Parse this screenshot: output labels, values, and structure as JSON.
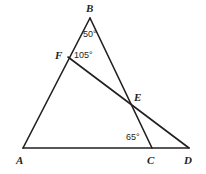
{
  "figure": {
    "type": "euclidean-geometry-diagram",
    "background_color": "#ffffff",
    "stroke_color": "#231f20",
    "text_color": "#231f20",
    "canvas": {
      "width": 206,
      "height": 174
    },
    "points": [
      {
        "id": "A",
        "label": "A",
        "x": 23,
        "y": 148,
        "label_x": 16,
        "label_y": 155
      },
      {
        "id": "B",
        "label": "B",
        "x": 90,
        "y": 18,
        "label_x": 86,
        "label_y": 3
      },
      {
        "id": "C",
        "label": "C",
        "x": 152,
        "y": 148,
        "label_x": 147,
        "label_y": 155
      },
      {
        "id": "D",
        "label": "D",
        "x": 189,
        "y": 148,
        "label_x": 184,
        "label_y": 155
      },
      {
        "id": "E",
        "label": "E",
        "x": 131,
        "y": 104,
        "label_x": 134,
        "label_y": 92
      },
      {
        "id": "F",
        "label": "F",
        "x": 68,
        "y": 57,
        "label_x": 55,
        "label_y": 50
      }
    ],
    "segments": [
      {
        "id": "AB",
        "from": "A",
        "to": "B",
        "stroke_width": 1.6
      },
      {
        "id": "BC",
        "from": "B",
        "to": "C",
        "stroke_width": 1.6
      },
      {
        "id": "AD",
        "from": "A",
        "to": "D",
        "stroke_width": 1.6
      },
      {
        "id": "FD",
        "from": "F",
        "to": "D",
        "stroke_width": 1.6
      }
    ],
    "angles": [
      {
        "id": "angle-B",
        "vertex": "B",
        "value": "50°",
        "label_x": 83,
        "label_y": 30
      },
      {
        "id": "angle-F",
        "vertex": "F",
        "value": "105°",
        "label_x": 74,
        "label_y": 51
      },
      {
        "id": "angle-C",
        "vertex": "C",
        "value": "65°",
        "label_x": 126,
        "label_y": 133
      }
    ]
  }
}
